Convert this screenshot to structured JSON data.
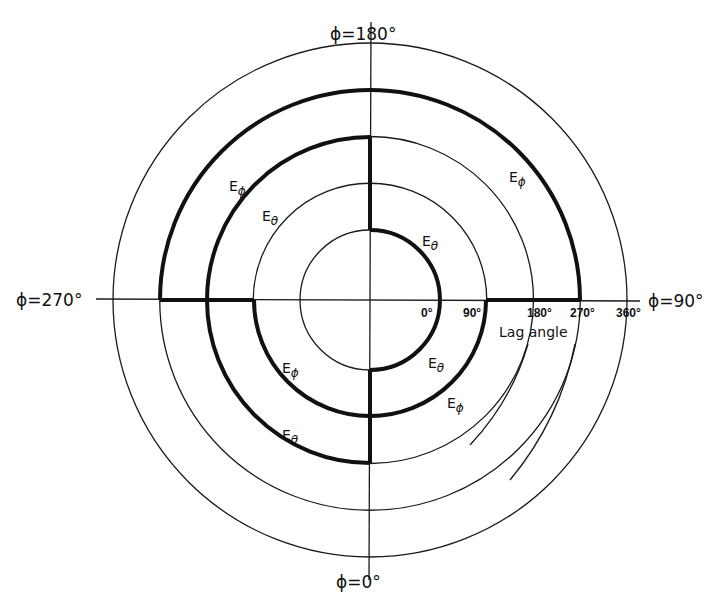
{
  "diagram": {
    "type": "polar-phase-diagram",
    "axis_labels": {
      "top": "ϕ=180°",
      "right": "ϕ=90°",
      "bottom": "ϕ=0°",
      "left": "ϕ=270°"
    },
    "lag_angle_ticks": [
      "0°",
      "90°",
      "180°",
      "270°",
      "360°"
    ],
    "lag_angle_caption": "Lag angle",
    "curve_labels": [
      {
        "main": "E",
        "sub": "ϕ",
        "region": "upper-left outer"
      },
      {
        "main": "E",
        "sub": "θ",
        "region": "upper-left middle"
      },
      {
        "main": "E",
        "sub": "ϕ",
        "region": "upper-right outer"
      },
      {
        "main": "E",
        "sub": "θ",
        "region": "upper-right inner"
      },
      {
        "main": "E",
        "sub": "θ",
        "region": "lower-right inner"
      },
      {
        "main": "E",
        "sub": "ϕ",
        "region": "lower-right second"
      },
      {
        "main": "E",
        "sub": "ϕ",
        "region": "lower-left second"
      },
      {
        "main": "E",
        "sub": "θ",
        "region": "lower-left middle"
      }
    ],
    "circles_lag_deg": [
      0,
      90,
      180,
      270,
      360
    ],
    "traces": {
      "E_theta": [
        {
          "phi_from": 180,
          "phi_to": 0,
          "via": 90,
          "lag": 0
        },
        {
          "phi": 0,
          "lag_from": 0,
          "lag_to": 90
        },
        {
          "phi": 180,
          "lag_from": 0,
          "lag_to": 180
        },
        {
          "phi_from": 180,
          "phi_to": 0,
          "via": 270,
          "lag": 180
        },
        {
          "phi": 0,
          "lag_from": 90,
          "lag_to": 180
        }
      ],
      "E_phi": [
        {
          "phi_from": 0,
          "phi_to": 90,
          "lag": 90
        },
        {
          "phi": 90,
          "lag_from": 90,
          "lag_to": 270
        },
        {
          "phi_from": 90,
          "phi_to": 270,
          "via": 180,
          "lag": 270
        },
        {
          "phi": 270,
          "lag_from": 90,
          "lag_to": 270
        },
        {
          "phi_from": 270,
          "phi_to": 0,
          "lag": 90
        }
      ]
    }
  }
}
